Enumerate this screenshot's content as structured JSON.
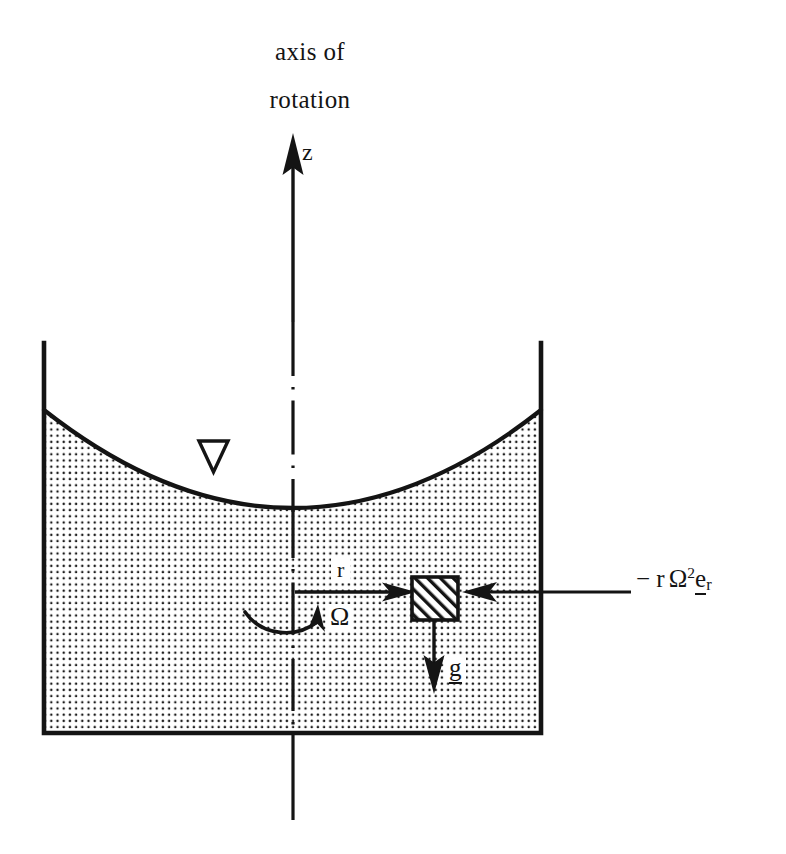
{
  "figure": {
    "kind": "physics-diagram",
    "title_line_1": "axis of",
    "title_line_2": "rotation"
  },
  "labels": {
    "axis_z": "z",
    "radius": "r",
    "angular_velocity": "Ω",
    "gravity": "g",
    "centrifugal_force_prefix": "− r",
    "centrifugal_force_omega": "Ω",
    "centrifugal_force_exponent": "2",
    "centrifugal_force_unit_vector": "e",
    "centrifugal_force_unit_subscript": "r"
  },
  "colors": {
    "ink": "#141414",
    "background": "#ffffff",
    "fluid_dots": "#1a1a1a"
  },
  "geometry": {
    "container_left_x": 42,
    "container_right_x": 543,
    "container_top_y": 343,
    "container_bottom_y": 735,
    "axis_x": 293,
    "surface_vertex_y": 510,
    "surface_edge_y": 410,
    "particle_box": {
      "x": 412,
      "y": 577,
      "w": 46,
      "h": 43
    }
  },
  "elements": {
    "z_axis_arrow": "upward-arrow",
    "centerline": "dash-dot-axis-of-rotation",
    "free_surface_marker": "hollow-down-triangle",
    "fluid_region": "dotted-fill",
    "fluid_particle": "hatched-square",
    "radius_arrow": "rightward-arrow",
    "centrifugal_arrow": "leftward-arrow",
    "gravity_arrow": "downward-arrow",
    "rotation_arrow": "counterclockwise-arc-arrow"
  }
}
